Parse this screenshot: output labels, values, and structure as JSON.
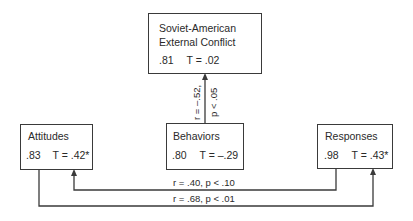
{
  "nodes": {
    "conflict": {
      "title_line1": "Soviet-American",
      "title_line2": "External Conflict",
      "reliability": ".81",
      "t_value": "T = .02"
    },
    "attitudes": {
      "title": "Attitudes",
      "reliability": ".83",
      "t_value": "T = .42*"
    },
    "behaviors": {
      "title": "Behaviors",
      "reliability": ".80",
      "t_value": "T = –.29"
    },
    "responses": {
      "title": "Responses",
      "reliability": ".98",
      "t_value": "T = .43*"
    }
  },
  "edges": {
    "behaviors_to_conflict": {
      "r_label": "r = –.52,",
      "p_label": "p < .05"
    },
    "responses_to_attitudes": {
      "label": "r = .40, p < .10"
    },
    "attitudes_to_responses": {
      "label": "r = .68, p < .01"
    }
  },
  "colors": {
    "line": "#3a3a3a",
    "text": "#2a2a2a",
    "background": "#ffffff"
  }
}
